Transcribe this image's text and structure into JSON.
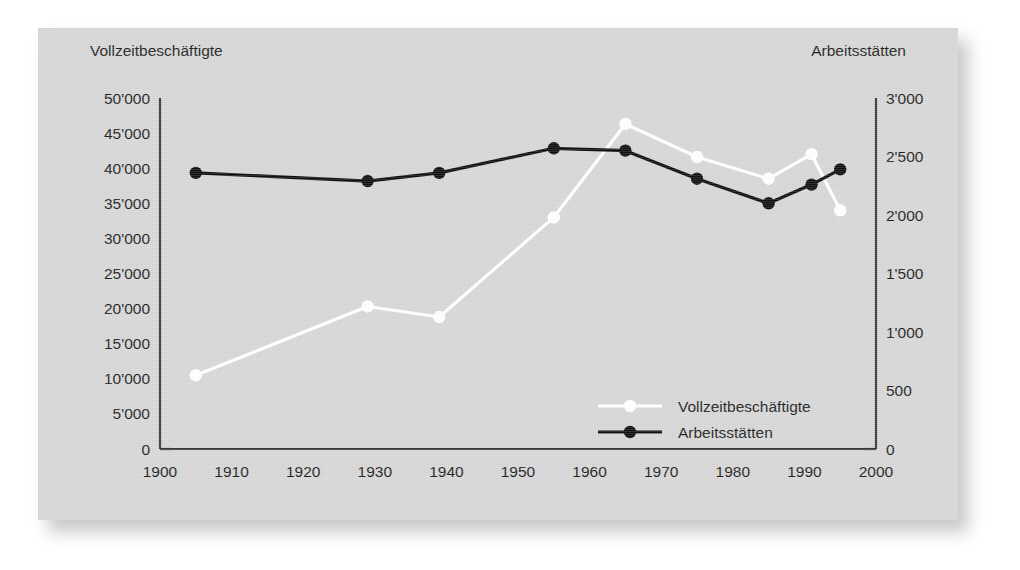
{
  "chart_data": {
    "type": "line",
    "title": "",
    "subtitle": "",
    "xlabel": "",
    "ylabel": "Vollzeitbeschäftigte",
    "y2label": "Arbeitsstätten",
    "xlim": [
      1900,
      2000
    ],
    "ylim": [
      0,
      50000
    ],
    "y2lim": [
      0,
      3000
    ],
    "grid": false,
    "legend_position": "inside-lower-right",
    "x_ticks": [
      "1900",
      "1910",
      "1920",
      "1930",
      "1940",
      "1950",
      "1960",
      "1970",
      "1980",
      "1990",
      "2000"
    ],
    "x_tick_values": [
      1900,
      1910,
      1920,
      1930,
      1940,
      1950,
      1960,
      1970,
      1980,
      1990,
      2000
    ],
    "y_ticks": [
      "0",
      "5'000",
      "10'000",
      "15'000",
      "20'000",
      "25'000",
      "30'000",
      "35'000",
      "40'000",
      "45'000",
      "50'000"
    ],
    "y_tick_values": [
      0,
      5000,
      10000,
      15000,
      20000,
      25000,
      30000,
      35000,
      40000,
      45000,
      50000
    ],
    "y2_ticks": [
      "0",
      "500",
      "1'000",
      "1'500",
      "2'000",
      "2'500",
      "3'000"
    ],
    "y2_tick_values": [
      0,
      500,
      1000,
      1500,
      2000,
      2500,
      3000
    ],
    "series": [
      {
        "name": "Vollzeitbeschäftigte",
        "axis": "left",
        "color": "#ffffff",
        "marker": "circle",
        "x": [
          1905,
          1929,
          1939,
          1955,
          1965,
          1975,
          1985,
          1991,
          1995
        ],
        "values": [
          10500,
          20300,
          18800,
          33000,
          46300,
          41600,
          38500,
          42000,
          34000
        ]
      },
      {
        "name": "Arbeitsstätten",
        "axis": "right",
        "color": "#111111",
        "marker": "circle",
        "x": [
          1905,
          1929,
          1939,
          1955,
          1965,
          1975,
          1985,
          1991,
          1995
        ],
        "values": [
          2360,
          2290,
          2360,
          2570,
          2550,
          2310,
          2100,
          2260,
          2390
        ]
      }
    ],
    "legend": [
      {
        "label": "Vollzeitbeschäftigte",
        "color": "#ffffff"
      },
      {
        "label": "Arbeitsstätten",
        "color": "#111111"
      }
    ]
  },
  "colors": {
    "card_background": "#d7d7d7",
    "page_background": "#ffffff",
    "axis": "#3a3a3a",
    "text": "#1f1f1f",
    "series_white": "#ffffff",
    "series_black": "#111111"
  }
}
